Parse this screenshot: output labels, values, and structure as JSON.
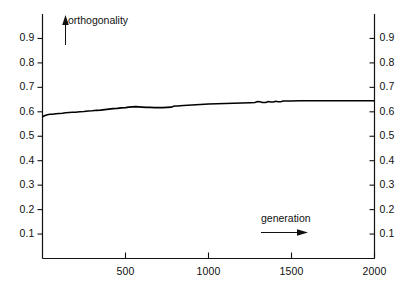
{
  "chart_data": {
    "type": "line",
    "title": "",
    "xlabel": "generation",
    "ylabel": "orthogonality",
    "xlim": [
      0,
      2000
    ],
    "ylim": [
      0,
      1.0
    ],
    "grid": false,
    "legend": null,
    "xticks": [
      500,
      1000,
      1500,
      2000
    ],
    "xtick_labels": [
      "500",
      "1000",
      "1500",
      "2000"
    ],
    "yticks": [
      0.1,
      0.2,
      0.3,
      0.4,
      0.5,
      0.6,
      0.7,
      0.8,
      0.9
    ],
    "ytick_labels": [
      "0.1",
      "0.2",
      "0.3",
      "0.4",
      "0.5",
      "0.6",
      "0.7",
      "0.8",
      "0.9"
    ],
    "right_axis_ticks": [
      0.1,
      0.2,
      0.3,
      0.4,
      0.5,
      0.6,
      0.7,
      0.8,
      0.9
    ],
    "right_axis_labels": [
      "0.1",
      "0.2",
      "0.3",
      "0.4",
      "0.5",
      "0.6",
      "0.7",
      "0.8",
      "0.9"
    ],
    "series": [
      {
        "name": "orthogonality",
        "color": "#000000",
        "x": [
          0,
          15,
          30,
          45,
          60,
          80,
          100,
          120,
          140,
          160,
          180,
          200,
          225,
          250,
          275,
          300,
          325,
          350,
          375,
          400,
          425,
          450,
          475,
          500,
          520,
          540,
          560,
          580,
          600,
          625,
          650,
          675,
          700,
          725,
          750,
          775,
          790,
          800,
          815,
          830,
          850,
          875,
          900,
          925,
          950,
          975,
          1000,
          1050,
          1100,
          1150,
          1200,
          1250,
          1280,
          1295,
          1310,
          1325,
          1345,
          1360,
          1375,
          1390,
          1405,
          1420,
          1435,
          1450,
          1470,
          1500,
          1550,
          1600,
          1700,
          1800,
          1900,
          2000
        ],
        "y": [
          0.58,
          0.585,
          0.588,
          0.59,
          0.59,
          0.592,
          0.593,
          0.594,
          0.596,
          0.597,
          0.598,
          0.598,
          0.6,
          0.601,
          0.603,
          0.604,
          0.606,
          0.607,
          0.609,
          0.611,
          0.613,
          0.614,
          0.616,
          0.617,
          0.619,
          0.62,
          0.621,
          0.62,
          0.619,
          0.618,
          0.618,
          0.617,
          0.617,
          0.617,
          0.618,
          0.619,
          0.623,
          0.624,
          0.624,
          0.625,
          0.626,
          0.627,
          0.628,
          0.629,
          0.63,
          0.631,
          0.632,
          0.633,
          0.634,
          0.635,
          0.636,
          0.637,
          0.638,
          0.642,
          0.641,
          0.638,
          0.638,
          0.642,
          0.64,
          0.64,
          0.643,
          0.641,
          0.641,
          0.644,
          0.644,
          0.644,
          0.645,
          0.645,
          0.645,
          0.645,
          0.645,
          0.645
        ],
        "start_value": 0.58,
        "end_value": 0.645
      }
    ],
    "annotations": [
      {
        "text": "orthogonality",
        "arrow": "up",
        "position": "top-left-inside"
      },
      {
        "text": "generation",
        "arrow": "right",
        "position": "bottom-right-inside"
      }
    ]
  },
  "axes": {
    "orthogonality_caption": "orthogonality",
    "generation_caption": "generation"
  }
}
